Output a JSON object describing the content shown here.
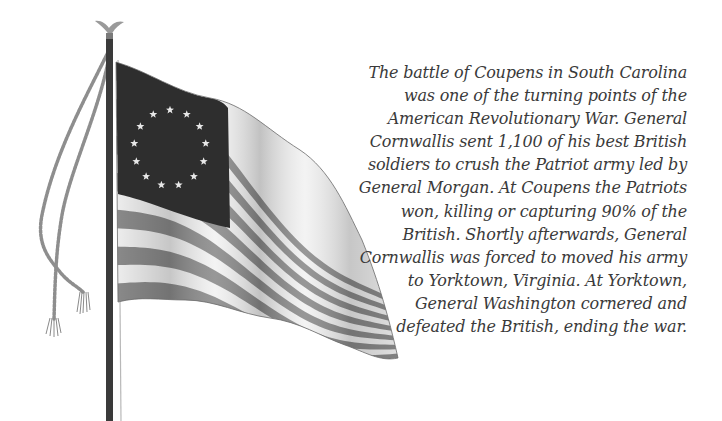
{
  "illustration": {
    "subject": "flag-on-pole",
    "flag_style": "Betsy Ross flag, 13 stars in a circle",
    "star_count": 13,
    "stripe_count": 13,
    "colors": {
      "canton": "#2e2e2e",
      "stripe_dark": "#8c8c8c",
      "stripe_light": "#f2f2f2",
      "pole": "#3a3a3a",
      "rope": "#8e8e8e",
      "finial": "#9a9a9a"
    }
  },
  "caption": {
    "lines": [
      "The battle of Coupens in South Carolina",
      "was one of the turning points of the",
      "American Revolutionary War. General",
      "Cornwallis sent 1,100 of his best British",
      "soldiers to crush the Patriot army led by",
      "General Morgan. At Coupens the Patriots",
      "won, killing or capturing 90% of the",
      "British. Shortly afterwards, General",
      "Cornwallis was forced to moved his army",
      "to Yorktown, Virginia. At Yorktown,",
      "General Washington cornered and",
      "defeated the British, ending the war."
    ]
  }
}
